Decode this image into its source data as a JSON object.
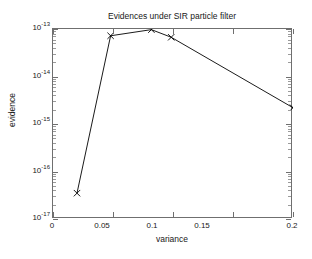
{
  "chart_data": {
    "type": "line",
    "title": "Evidences under SIR particle filter",
    "xlabel": "variance",
    "ylabel": "evidence",
    "xscale": "linear",
    "yscale": "log",
    "xlim": [
      0,
      0.2
    ],
    "ylim": [
      1e-17,
      1e-13
    ],
    "grid": false,
    "legend": null,
    "marker": "x",
    "line_color": "#000000",
    "xticks": [
      "0",
      "0.05",
      "0.1",
      "0.15",
      "0.2"
    ],
    "xtick_values": [
      0,
      0.05,
      0.1,
      0.15,
      0.2
    ],
    "ytick_labels": [
      "10",
      "10",
      "10",
      "10",
      "10"
    ],
    "ytick_exponents": [
      "-13",
      "-14",
      "-15",
      "-16",
      "-17"
    ],
    "ytick_values": [
      1e-13,
      1e-14,
      1e-15,
      1e-16,
      1e-17
    ],
    "x": [
      0.02,
      0.048,
      0.082,
      0.0985,
      0.2
    ],
    "y": [
      3.5e-17,
      7.2e-14,
      9.7e-14,
      6.7e-14,
      2.2e-15
    ],
    "series": [
      {
        "name": "evidence",
        "points": [
          {
            "x": 0.02,
            "y": 3.5e-17
          },
          {
            "x": 0.048,
            "y": 7.2e-14
          },
          {
            "x": 0.082,
            "y": 9.7e-14
          },
          {
            "x": 0.0985,
            "y": 6.7e-14
          },
          {
            "x": 0.2,
            "y": 2.2e-15
          }
        ]
      }
    ]
  },
  "figure": {
    "background": "#ffffff",
    "axes_color": "#6f6f6f"
  }
}
